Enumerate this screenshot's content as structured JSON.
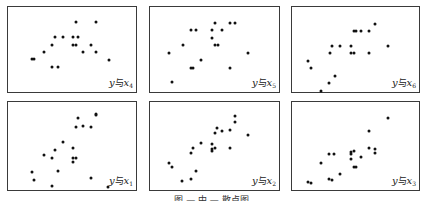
{
  "figure": {
    "caption": "图 — 中 — 散点图"
  },
  "chart_data": [
    {
      "type": "scatter",
      "title": "",
      "label": "y与x4",
      "label_parts": {
        "y": "y",
        "connector": "与",
        "x": "x",
        "sub": "4"
      },
      "grid": false,
      "panel": {
        "left": 7,
        "top": 6,
        "width": 130,
        "height": 87
      },
      "points": [
        [
          31,
          58
        ],
        [
          33,
          58
        ],
        [
          43,
          51
        ],
        [
          51,
          44
        ],
        [
          54,
          36
        ],
        [
          62,
          36
        ],
        [
          72,
          36
        ],
        [
          77,
          36
        ],
        [
          72,
          44
        ],
        [
          75,
          44
        ],
        [
          75,
          21
        ],
        [
          95,
          21
        ],
        [
          90,
          44
        ],
        [
          82,
          51
        ],
        [
          95,
          51
        ],
        [
          108,
          59
        ],
        [
          51,
          66
        ],
        [
          57,
          66
        ]
      ]
    },
    {
      "type": "scatter",
      "title": "",
      "label": "y与x5",
      "label_parts": {
        "y": "y",
        "connector": "与",
        "x": "x",
        "sub": "5"
      },
      "grid": false,
      "panel": {
        "left": 149,
        "top": 6,
        "width": 131,
        "height": 87
      },
      "points": [
        [
          214,
          22
        ],
        [
          229,
          22
        ],
        [
          234,
          22
        ],
        [
          190,
          29
        ],
        [
          195,
          29
        ],
        [
          211,
          29
        ],
        [
          221,
          29
        ],
        [
          211,
          37
        ],
        [
          182,
          44
        ],
        [
          214,
          44
        ],
        [
          217,
          44
        ],
        [
          168,
          52
        ],
        [
          247,
          52
        ],
        [
          200,
          59
        ],
        [
          190,
          67
        ],
        [
          192,
          67
        ],
        [
          229,
          67
        ],
        [
          171,
          81
        ]
      ]
    },
    {
      "type": "scatter",
      "title": "",
      "label": "y与x6",
      "label_parts": {
        "y": "y",
        "connector": "与",
        "x": "x",
        "sub": "6"
      },
      "grid": false,
      "panel": {
        "left": 291,
        "top": 6,
        "width": 129,
        "height": 87
      },
      "points": [
        [
          374,
          23
        ],
        [
          353,
          30
        ],
        [
          355,
          30
        ],
        [
          360,
          30
        ],
        [
          368,
          30
        ],
        [
          331,
          45
        ],
        [
          339,
          45
        ],
        [
          350,
          45
        ],
        [
          329,
          52
        ],
        [
          350,
          52
        ],
        [
          353,
          52
        ],
        [
          368,
          52
        ],
        [
          387,
          45
        ],
        [
          307,
          60
        ],
        [
          310,
          67
        ],
        [
          334,
          75
        ],
        [
          328,
          82
        ],
        [
          320,
          90
        ]
      ]
    },
    {
      "type": "scatter",
      "title": "",
      "label": "y与x1",
      "label_parts": {
        "y": "y",
        "connector": "与",
        "x": "x",
        "sub": "1"
      },
      "grid": false,
      "panel": {
        "left": 7,
        "top": 101,
        "width": 130,
        "height": 90
      },
      "points": [
        [
          95,
          113
        ],
        [
          95,
          114
        ],
        [
          77,
          117
        ],
        [
          75,
          126
        ],
        [
          82,
          125
        ],
        [
          90,
          126
        ],
        [
          62,
          141
        ],
        [
          72,
          147
        ],
        [
          54,
          149
        ],
        [
          43,
          154
        ],
        [
          51,
          157
        ],
        [
          72,
          157
        ],
        [
          75,
          157
        ],
        [
          72,
          161
        ],
        [
          31,
          171
        ],
        [
          57,
          170
        ],
        [
          33,
          179
        ],
        [
          90,
          177
        ],
        [
          51,
          185
        ],
        [
          107,
          186
        ]
      ]
    },
    {
      "type": "scatter",
      "title": "",
      "label": "y与x2",
      "label_parts": {
        "y": "y",
        "connector": "与",
        "x": "x",
        "sub": "2"
      },
      "grid": false,
      "panel": {
        "left": 149,
        "top": 101,
        "width": 131,
        "height": 90
      },
      "points": [
        [
          234,
          115
        ],
        [
          234,
          121
        ],
        [
          216,
          127
        ],
        [
          214,
          132
        ],
        [
          221,
          130
        ],
        [
          229,
          129
        ],
        [
          247,
          134
        ],
        [
          200,
          142
        ],
        [
          211,
          143
        ],
        [
          192,
          147
        ],
        [
          190,
          152
        ],
        [
          211,
          148
        ],
        [
          211,
          150
        ],
        [
          214,
          147
        ],
        [
          229,
          147
        ],
        [
          168,
          162
        ],
        [
          171,
          166
        ],
        [
          195,
          170
        ],
        [
          190,
          178
        ],
        [
          181,
          180
        ]
      ]
    },
    {
      "type": "scatter",
      "title": "",
      "label": "y与x3",
      "label_parts": {
        "y": "y",
        "connector": "与",
        "x": "x",
        "sub": "3"
      },
      "grid": false,
      "panel": {
        "left": 291,
        "top": 101,
        "width": 129,
        "height": 90
      },
      "points": [
        [
          387,
          117
        ],
        [
          368,
          130
        ],
        [
          368,
          147
        ],
        [
          374,
          148
        ],
        [
          374,
          152
        ],
        [
          328,
          153
        ],
        [
          333,
          153
        ],
        [
          350,
          151
        ],
        [
          353,
          150
        ],
        [
          350,
          153
        ],
        [
          360,
          156
        ],
        [
          350,
          158
        ],
        [
          320,
          162
        ],
        [
          353,
          166
        ],
        [
          355,
          166
        ],
        [
          339,
          173
        ],
        [
          328,
          178
        ],
        [
          331,
          179
        ],
        [
          307,
          181
        ],
        [
          310,
          182
        ]
      ]
    }
  ]
}
